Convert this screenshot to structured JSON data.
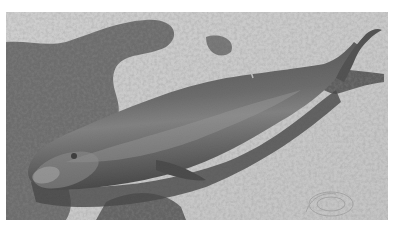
{
  "photo": {
    "description": "Grayscale photograph of a stranded dark cetacean lying on a sandy beach amid seaweed",
    "colors": {
      "sand": "#c9c9c9",
      "sand_light": "#d6d6d6",
      "seaweed": "#4a4a4a",
      "seaweed_dark": "#2e2e2e",
      "body_dark": "#2a2a2a",
      "body_mid": "#4d4d4d",
      "body_highlight": "#8a8a8a",
      "border": "#ffffff"
    }
  }
}
